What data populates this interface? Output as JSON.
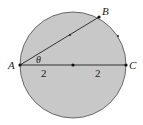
{
  "diagram": {
    "circle": {
      "cx": 73,
      "cy": 65,
      "r": 53,
      "fill": "#c8c8c8",
      "stroke": "#4a4a4a"
    },
    "points": {
      "A": {
        "label": "A",
        "x": 20,
        "y": 65
      },
      "B": {
        "label": "B",
        "x": 99,
        "y": 17
      },
      "C": {
        "label": "C",
        "x": 126,
        "y": 65
      },
      "center": {
        "x": 73,
        "y": 65
      },
      "chord_mid": {
        "x": 70,
        "y": 35
      },
      "arc_mark": {
        "x": 118,
        "y": 36
      }
    },
    "labels": {
      "A": "A",
      "B": "B",
      "C": "C",
      "theta": "θ",
      "seg_left": "2",
      "seg_right": "2"
    }
  }
}
